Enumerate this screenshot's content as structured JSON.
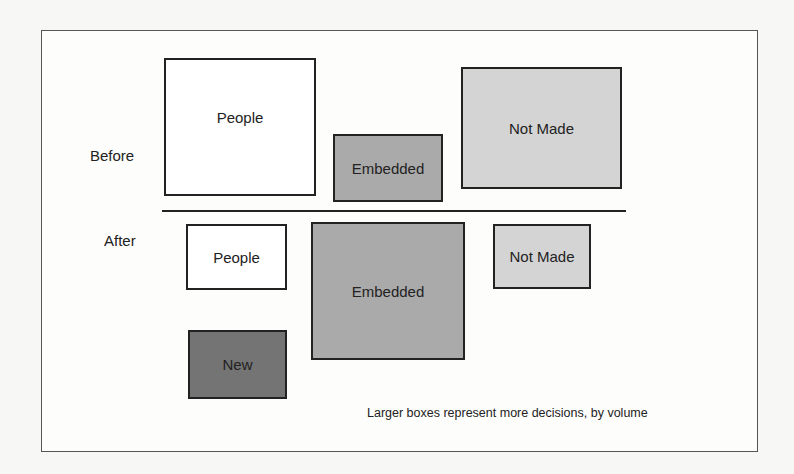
{
  "diagram": {
    "rows": [
      {
        "label": "Before",
        "boxes": [
          {
            "label": "People",
            "fill": "#ffffff"
          },
          {
            "label": "Embedded",
            "fill": "#aaaaaa"
          },
          {
            "label": "Not Made",
            "fill": "#d4d4d4"
          }
        ]
      },
      {
        "label": "After",
        "boxes": [
          {
            "label": "People",
            "fill": "#ffffff"
          },
          {
            "label": "Embedded",
            "fill": "#aaaaaa"
          },
          {
            "label": "Not Made",
            "fill": "#d4d4d4"
          },
          {
            "label": "New",
            "fill": "#747474"
          }
        ]
      }
    ],
    "caption": "Larger boxes represent more decisions, by volume"
  }
}
